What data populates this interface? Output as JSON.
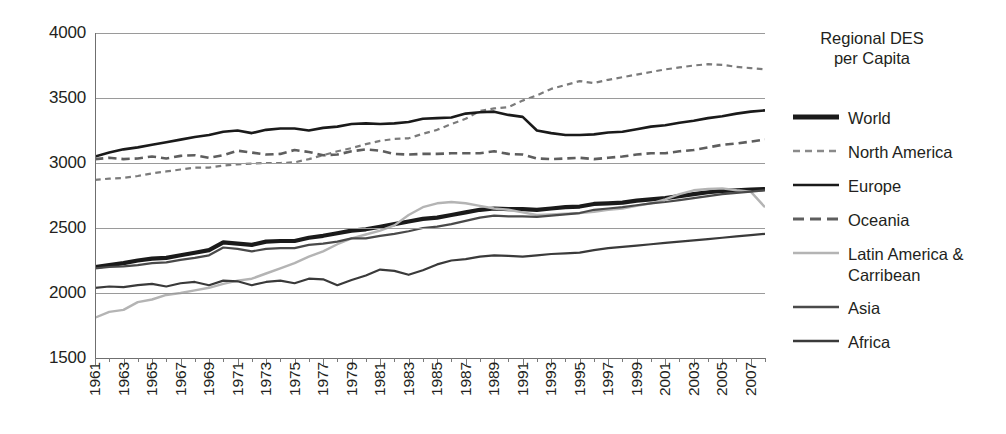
{
  "chart_data": {
    "type": "line",
    "title": "",
    "xlabel": "",
    "ylabel": "",
    "ylim": [
      1500,
      4000
    ],
    "ytick_step": 500,
    "yticks": [
      "1500",
      "2000",
      "2500",
      "3000",
      "3500",
      "4000"
    ],
    "xlim": [
      1961,
      2008
    ],
    "xticks": [
      "1961",
      "1963",
      "1965",
      "1967",
      "1969",
      "1971",
      "1973",
      "1975",
      "1977",
      "1979",
      "1981",
      "1983",
      "1985",
      "1987",
      "1989",
      "1991",
      "1993",
      "1995",
      "1997",
      "1999",
      "2001",
      "2003",
      "2005",
      "2007"
    ],
    "grid": true,
    "legend_position": "right",
    "legend_title": "Regional DES\nper Capita",
    "x": [
      1961,
      1962,
      1963,
      1964,
      1965,
      1966,
      1967,
      1968,
      1969,
      1970,
      1971,
      1972,
      1973,
      1974,
      1975,
      1976,
      1977,
      1978,
      1979,
      1980,
      1981,
      1982,
      1983,
      1984,
      1985,
      1986,
      1987,
      1988,
      1989,
      1990,
      1991,
      1992,
      1993,
      1994,
      1995,
      1996,
      1997,
      1998,
      1999,
      2000,
      2001,
      2002,
      2003,
      2004,
      2005,
      2006,
      2007,
      2008
    ],
    "series": [
      {
        "name": "World",
        "style": "solid",
        "width": 4.2,
        "color": "#1a1a1a",
        "values": [
          2200,
          2215,
          2230,
          2250,
          2265,
          2270,
          2290,
          2310,
          2330,
          2390,
          2380,
          2370,
          2395,
          2400,
          2400,
          2425,
          2440,
          2460,
          2480,
          2490,
          2510,
          2530,
          2550,
          2570,
          2580,
          2600,
          2620,
          2640,
          2650,
          2645,
          2645,
          2640,
          2650,
          2660,
          2665,
          2685,
          2690,
          2695,
          2710,
          2720,
          2730,
          2745,
          2760,
          2775,
          2785,
          2790,
          2795,
          2800
        ]
      },
      {
        "name": "North America",
        "style": "dotted-dash",
        "width": 2.2,
        "color": "#7b7b7b",
        "values": [
          2870,
          2880,
          2885,
          2900,
          2920,
          2935,
          2950,
          2965,
          2965,
          2980,
          2990,
          2995,
          3000,
          3000,
          3005,
          3030,
          3060,
          3090,
          3115,
          3145,
          3170,
          3185,
          3190,
          3225,
          3255,
          3300,
          3340,
          3400,
          3420,
          3430,
          3480,
          3520,
          3570,
          3600,
          3630,
          3615,
          3640,
          3660,
          3680,
          3700,
          3720,
          3735,
          3750,
          3760,
          3755,
          3740,
          3730,
          3720
        ]
      },
      {
        "name": "Europe",
        "style": "solid",
        "width": 2.6,
        "color": "#1a1a1a",
        "values": [
          3050,
          3080,
          3105,
          3120,
          3140,
          3160,
          3180,
          3200,
          3215,
          3240,
          3250,
          3230,
          3255,
          3265,
          3265,
          3250,
          3270,
          3280,
          3300,
          3305,
          3300,
          3305,
          3315,
          3340,
          3345,
          3350,
          3380,
          3390,
          3395,
          3370,
          3355,
          3250,
          3230,
          3215,
          3215,
          3220,
          3235,
          3240,
          3260,
          3280,
          3290,
          3310,
          3325,
          3345,
          3360,
          3380,
          3395,
          3405
        ]
      },
      {
        "name": "Oceania",
        "style": "dashed",
        "width": 2.6,
        "color": "#5e5e5e",
        "values": [
          3030,
          3040,
          3030,
          3035,
          3050,
          3035,
          3055,
          3060,
          3040,
          3060,
          3095,
          3080,
          3065,
          3070,
          3100,
          3085,
          3060,
          3065,
          3090,
          3105,
          3095,
          3070,
          3065,
          3070,
          3070,
          3075,
          3075,
          3075,
          3090,
          3070,
          3065,
          3035,
          3030,
          3035,
          3040,
          3030,
          3040,
          3050,
          3065,
          3075,
          3075,
          3090,
          3100,
          3120,
          3140,
          3150,
          3165,
          3180
        ]
      },
      {
        "name": "Latin America &\nCarribean",
        "style": "solid",
        "width": 2.4,
        "color": "#b4b4b4",
        "values": [
          1810,
          1855,
          1870,
          1930,
          1950,
          1985,
          2000,
          2020,
          2040,
          2070,
          2095,
          2110,
          2150,
          2190,
          2230,
          2280,
          2320,
          2375,
          2420,
          2450,
          2480,
          2520,
          2600,
          2660,
          2690,
          2700,
          2690,
          2670,
          2650,
          2640,
          2620,
          2600,
          2605,
          2610,
          2615,
          2625,
          2640,
          2650,
          2670,
          2690,
          2720,
          2760,
          2790,
          2800,
          2805,
          2790,
          2780,
          2660
        ]
      },
      {
        "name": "Asia",
        "style": "solid",
        "width": 2.2,
        "color": "#4a4a4a",
        "values": [
          2190,
          2200,
          2205,
          2215,
          2230,
          2235,
          2255,
          2270,
          2290,
          2350,
          2340,
          2320,
          2340,
          2345,
          2345,
          2370,
          2380,
          2395,
          2420,
          2420,
          2440,
          2455,
          2475,
          2500,
          2510,
          2530,
          2555,
          2580,
          2595,
          2590,
          2590,
          2585,
          2595,
          2605,
          2615,
          2640,
          2650,
          2660,
          2675,
          2690,
          2700,
          2715,
          2730,
          2745,
          2760,
          2770,
          2780,
          2790
        ]
      },
      {
        "name": "Africa",
        "style": "solid",
        "width": 2.2,
        "color": "#3a3a3a",
        "values": [
          2040,
          2050,
          2045,
          2060,
          2070,
          2050,
          2075,
          2085,
          2060,
          2095,
          2090,
          2060,
          2085,
          2095,
          2075,
          2110,
          2105,
          2060,
          2100,
          2135,
          2180,
          2170,
          2140,
          2175,
          2220,
          2250,
          2260,
          2280,
          2290,
          2285,
          2280,
          2290,
          2300,
          2305,
          2310,
          2330,
          2345,
          2355,
          2365,
          2375,
          2385,
          2395,
          2405,
          2415,
          2425,
          2435,
          2445,
          2455
        ]
      }
    ]
  },
  "legend": {
    "title_line1": "Regional DES",
    "title_line2": "per Capita",
    "items": [
      {
        "label": "World",
        "swatch": "thick-solid"
      },
      {
        "label": "North America",
        "swatch": "fine-dash"
      },
      {
        "label": "Europe",
        "swatch": "solid"
      },
      {
        "label": "Oceania",
        "swatch": "long-dash"
      },
      {
        "label": "Latin America &\nCarribean",
        "swatch": "light-solid"
      },
      {
        "label": "Asia",
        "swatch": "dotted-solid"
      },
      {
        "label": "Africa",
        "swatch": "dark-solid"
      }
    ]
  }
}
